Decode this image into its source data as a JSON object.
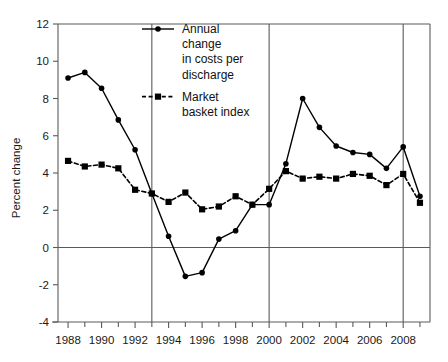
{
  "chart_data": {
    "type": "line",
    "title": "",
    "xlabel": "",
    "ylabel": "Percent change",
    "xlim": [
      1987.4,
      2009.6
    ],
    "ylim": [
      -4,
      12
    ],
    "grid": false,
    "legend_position": "top-center",
    "y_ticks": [
      "12",
      "10",
      "8",
      "6",
      "4",
      "2",
      "0",
      "-2",
      "-4"
    ],
    "y_tick_values": [
      12,
      10,
      8,
      6,
      4,
      2,
      0,
      -2,
      -4
    ],
    "x_ticks": [
      "1988",
      "1990",
      "1992",
      "1994",
      "1996",
      "1998",
      "2000",
      "2002",
      "2004",
      "2006",
      "2008"
    ],
    "x_tick_values": [
      1988,
      1990,
      1992,
      1994,
      1996,
      1998,
      2000,
      2002,
      2004,
      2006,
      2008
    ],
    "x_minor_tick_values": [
      1989,
      1991,
      1993,
      1995,
      1997,
      1999,
      2001,
      2003,
      2005,
      2007,
      2009
    ],
    "vertical_reference_lines": [
      1993,
      2000,
      2008
    ],
    "zero_line": 0,
    "x": [
      1988,
      1989,
      1990,
      1991,
      1992,
      1993,
      1994,
      1995,
      1996,
      1997,
      1998,
      1999,
      2000,
      2001,
      2002,
      2003,
      2004,
      2005,
      2006,
      2007,
      2008,
      2009
    ],
    "series": [
      {
        "name": "Annual change in costs per discharge",
        "marker": "circle",
        "line_style": "solid",
        "color": "#000000",
        "values": [
          9.1,
          9.4,
          8.55,
          6.85,
          5.25,
          2.9,
          0.6,
          -1.55,
          -1.35,
          0.45,
          0.9,
          2.3,
          2.3,
          4.5,
          8.0,
          6.45,
          5.45,
          5.1,
          5.0,
          4.25,
          5.4,
          2.75
        ]
      },
      {
        "name": "Market basket index",
        "marker": "square",
        "line_style": "dashed",
        "color": "#000000",
        "values": [
          4.65,
          4.35,
          4.45,
          4.25,
          3.1,
          2.9,
          2.45,
          2.95,
          2.05,
          2.2,
          2.75,
          2.3,
          3.15,
          4.1,
          3.7,
          3.8,
          3.7,
          3.95,
          3.85,
          3.35,
          3.95,
          2.4
        ]
      }
    ],
    "annotations": []
  },
  "legend": {
    "entries": [
      {
        "label_lines": [
          "Annual",
          "change",
          "in costs per",
          "discharge"
        ],
        "style": "solid-circle"
      },
      {
        "label_lines": [
          "Market",
          "basket index"
        ],
        "style": "dashed-square"
      }
    ]
  },
  "colors": {
    "ink": "#000000",
    "axis": "#5a5a5a",
    "background": "#ffffff",
    "text": "#1a1a1a"
  }
}
